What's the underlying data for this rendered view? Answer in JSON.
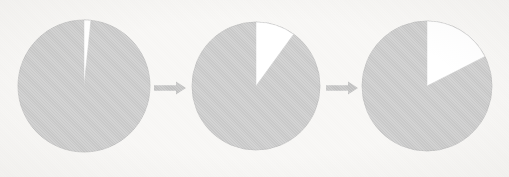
{
  "figure": {
    "background_color": "#f7f6f4",
    "width": 509,
    "height": 177
  },
  "colors": {
    "background": "#f7f6f4",
    "pie_fill": "#c9c9c9",
    "pie_stroke": "#bdbdbd",
    "slice_highlight": "#ffffff",
    "slice_highlight_stroke": "#c9c9c9",
    "arrow": "#c2c2c2"
  },
  "chart_data": {
    "type": "pie",
    "xlabel": "",
    "ylabel": "",
    "legend_position": "none",
    "grid": false,
    "start_angle_deg": 0,
    "direction": "clockwise",
    "panels": [
      {
        "id": "pie-1",
        "label": "Stage 1",
        "center_x": 84,
        "center_y": 86,
        "radius": 66,
        "slices": [
          {
            "name": "Highlighted",
            "color": "#ffffff",
            "angle_deg": 6,
            "value": 1.7
          },
          {
            "name": "Remainder",
            "color": "#c9c9c9",
            "angle_deg": 354,
            "value": 98.3
          }
        ]
      },
      {
        "id": "pie-2",
        "label": "Stage 2",
        "center_x": 256,
        "center_y": 86,
        "radius": 64,
        "slices": [
          {
            "name": "Highlighted",
            "color": "#ffffff",
            "angle_deg": 36,
            "value": 10
          },
          {
            "name": "Remainder",
            "color": "#c9c9c9",
            "angle_deg": 324,
            "value": 90
          }
        ]
      },
      {
        "id": "pie-3",
        "label": "Stage 3",
        "center_x": 427,
        "center_y": 86,
        "radius": 65,
        "slices": [
          {
            "name": "Highlighted",
            "color": "#ffffff",
            "angle_deg": 63,
            "value": 17.5
          },
          {
            "name": "Remainder",
            "color": "#c9c9c9",
            "angle_deg": 297,
            "value": 82.5
          }
        ]
      }
    ],
    "connectors": [
      {
        "id": "arrow-1",
        "from": "pie-1",
        "to": "pie-2",
        "x_start": 154,
        "x_end": 186,
        "y": 88
      },
      {
        "id": "arrow-2",
        "from": "pie-2",
        "to": "pie-3",
        "x_start": 326,
        "x_end": 358,
        "y": 88
      }
    ]
  }
}
